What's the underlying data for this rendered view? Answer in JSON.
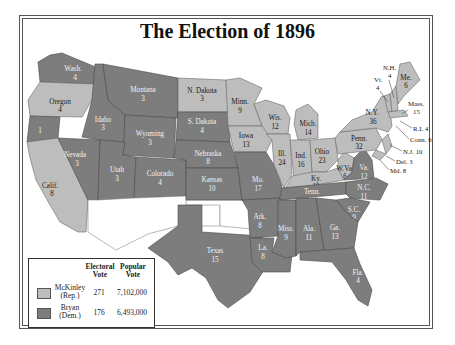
{
  "title": "The Election of 1896",
  "colors": {
    "mckinley": "#bdbdbd",
    "bryan": "#7d7d7d"
  },
  "legend": {
    "headers": {
      "electoral": "Electoral Vote",
      "electoral_1": "Electoral",
      "electoral_2": "Vote",
      "popular_1": "Popular",
      "popular_2": "Vote"
    },
    "rows": [
      {
        "name_1": "McKinley",
        "name_2": "(Rep.)",
        "electoral_vote": "271",
        "popular_vote": "7,102,000"
      },
      {
        "name_1": "Bryan",
        "name_2": "(Dem.)",
        "electoral_vote": "176",
        "popular_vote": "6,493,000"
      }
    ]
  },
  "states": {
    "wash": {
      "name": "Wash.",
      "ev": "4",
      "party": "dem"
    },
    "oregon": {
      "name": "Oregon",
      "ev": "4",
      "party": "rep"
    },
    "calif": {
      "name": "Calif.",
      "ev": "8",
      "party": "rep"
    },
    "calif_dem": {
      "ev": "1",
      "party": "dem"
    },
    "nevada": {
      "name": "Nevada",
      "ev": "3",
      "party": "dem"
    },
    "idaho": {
      "name": "Idaho",
      "ev": "3",
      "party": "dem"
    },
    "montana": {
      "name": "Montana",
      "ev": "3",
      "party": "dem"
    },
    "wyoming": {
      "name": "Wyoming",
      "ev": "3",
      "party": "dem"
    },
    "utah": {
      "name": "Utah",
      "ev": "3",
      "party": "dem"
    },
    "colorado": {
      "name": "Colorado",
      "ev": "4",
      "party": "dem"
    },
    "ndakota": {
      "name": "N. Dakota",
      "ev": "3",
      "party": "rep"
    },
    "sdakota": {
      "name": "S. Dakota",
      "ev": "4",
      "party": "dem"
    },
    "nebraska": {
      "name": "Nebraska",
      "ev": "8",
      "party": "dem"
    },
    "kansas": {
      "name": "Kansas",
      "ev": "10",
      "party": "dem"
    },
    "texas": {
      "name": "Texas",
      "ev": "15",
      "party": "dem"
    },
    "minn": {
      "name": "Minn.",
      "ev": "9",
      "party": "rep"
    },
    "iowa": {
      "name": "Iowa",
      "ev": "13",
      "party": "rep"
    },
    "mo": {
      "name": "Mo.",
      "ev": "17",
      "party": "dem"
    },
    "ark": {
      "name": "Ark.",
      "ev": "8",
      "party": "dem"
    },
    "la": {
      "name": "La.",
      "ev": "8",
      "party": "dem"
    },
    "wis": {
      "name": "Wis.",
      "ev": "12",
      "party": "rep"
    },
    "ill": {
      "name": "Ill.",
      "ev": "24",
      "party": "rep"
    },
    "mich": {
      "name": "Mich.",
      "ev": "14",
      "party": "rep"
    },
    "ind": {
      "name": "Ind.",
      "ev": "16",
      "party": "rep"
    },
    "ohio": {
      "name": "Ohio",
      "ev": "23",
      "party": "rep"
    },
    "ky": {
      "name": "Ky.",
      "ev": "12",
      "party": "rep"
    },
    "tenn": {
      "name": "Tenn.",
      "ev": "12",
      "party": "dem"
    },
    "miss": {
      "name": "Miss.",
      "ev": "9",
      "party": "dem"
    },
    "ala": {
      "name": "Ala.",
      "ev": "11",
      "party": "dem"
    },
    "ga": {
      "name": "Ga.",
      "ev": "13",
      "party": "dem"
    },
    "fla": {
      "name": "Fla.",
      "ev": "4",
      "party": "dem"
    },
    "sc": {
      "name": "S.C.",
      "ev": "9",
      "party": "dem"
    },
    "nc": {
      "name": "N.C.",
      "ev": "11",
      "party": "dem"
    },
    "va": {
      "name": "Va.",
      "ev": "12",
      "party": "dem"
    },
    "wva": {
      "name": "W.Va.",
      "ev": "6",
      "party": "rep"
    },
    "penn": {
      "name": "Penn.",
      "ev": "32",
      "party": "rep"
    },
    "ny": {
      "name": "N.Y.",
      "ev": "36",
      "party": "rep"
    },
    "vt": {
      "name": "Vt.",
      "ev": "4",
      "party": "rep"
    },
    "nh": {
      "name": "N.H.",
      "ev": "4",
      "party": "rep"
    },
    "me": {
      "name": "Me.",
      "ev": "6",
      "party": "rep"
    },
    "mass": {
      "name": "Mass.",
      "ev": "15",
      "party": "rep"
    },
    "ri": {
      "label": "R.I. 4",
      "party": "rep"
    },
    "conn": {
      "label": "Conn. 6",
      "party": "rep"
    },
    "nj": {
      "label": "N.J. 10",
      "party": "rep"
    },
    "del": {
      "label": "Del. 3",
      "party": "rep"
    },
    "md": {
      "label": "Md. 8",
      "party": "rep"
    }
  }
}
